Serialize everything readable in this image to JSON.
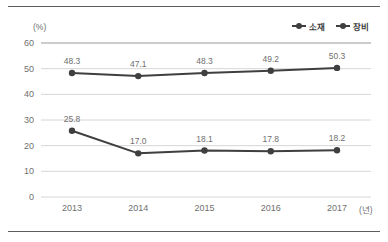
{
  "chart_data": {
    "type": "line",
    "title": "",
    "xlabel": "(년)",
    "ylabel": "(%)",
    "x": [
      "2013",
      "2014",
      "2015",
      "2016",
      "2017"
    ],
    "categories": [
      "2013",
      "2014",
      "2015",
      "2016",
      "2017"
    ],
    "ylim": [
      0,
      60
    ],
    "yticks": [
      "0",
      "10",
      "20",
      "30",
      "40",
      "50",
      "60"
    ],
    "grid": true,
    "legend_position": "top-right",
    "series": [
      {
        "name": "소재",
        "values": [
          48.3,
          47.1,
          48.3,
          49.2,
          50.3
        ],
        "labels": [
          "48.3",
          "47.1",
          "48.3",
          "49.2",
          "50.3"
        ],
        "color": "#3f3f3f"
      },
      {
        "name": "장비",
        "values": [
          25.8,
          17.0,
          18.1,
          17.8,
          18.2
        ],
        "labels": [
          "25.8",
          "17.0",
          "18.1",
          "17.8",
          "18.2"
        ],
        "color": "#3f3f3f"
      }
    ]
  },
  "axes": {
    "y_unit": "(%)",
    "x_unit": "(년)"
  },
  "legend": {
    "items": [
      {
        "label": "소재"
      },
      {
        "label": "장비"
      }
    ]
  },
  "colors": {
    "line": "#3f3f3f",
    "grid": "#d6d6d6",
    "axis_text": "#6f6f6f",
    "rule": "#5c5c5c"
  }
}
